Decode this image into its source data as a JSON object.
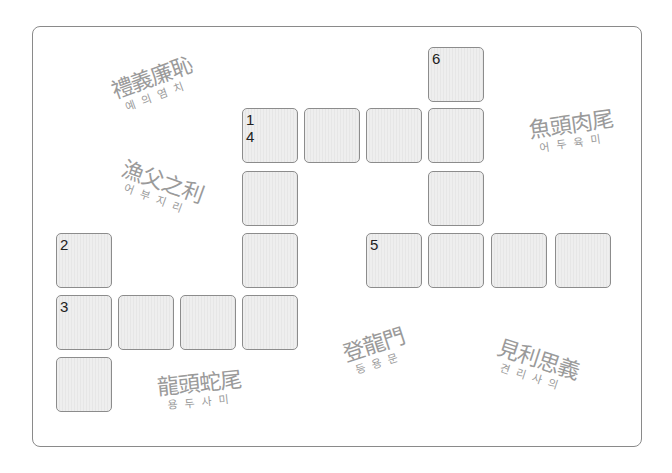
{
  "puzzle": {
    "type": "crossword",
    "cell_fill": "#eaeaea",
    "cell_border": "#8c8c8c",
    "cells": [
      {
        "row": 0,
        "col": 6,
        "label": "6"
      },
      {
        "row": 1,
        "col": 3,
        "label": "1\n4"
      },
      {
        "row": 1,
        "col": 4,
        "label": ""
      },
      {
        "row": 1,
        "col": 5,
        "label": ""
      },
      {
        "row": 1,
        "col": 6,
        "label": ""
      },
      {
        "row": 2,
        "col": 3,
        "label": ""
      },
      {
        "row": 2,
        "col": 6,
        "label": ""
      },
      {
        "row": 3,
        "col": 0,
        "label": "2"
      },
      {
        "row": 3,
        "col": 3,
        "label": ""
      },
      {
        "row": 3,
        "col": 5,
        "label": "5"
      },
      {
        "row": 3,
        "col": 6,
        "label": ""
      },
      {
        "row": 3,
        "col": 7,
        "label": ""
      },
      {
        "row": 3,
        "col": 8,
        "label": ""
      },
      {
        "row": 4,
        "col": 0,
        "label": "3"
      },
      {
        "row": 4,
        "col": 1,
        "label": ""
      },
      {
        "row": 4,
        "col": 2,
        "label": ""
      },
      {
        "row": 4,
        "col": 3,
        "label": ""
      },
      {
        "row": 5,
        "col": 0,
        "label": ""
      }
    ]
  },
  "idioms": [
    {
      "id": "ye-ui-yeom-chi",
      "hanja": "禮義廉恥",
      "hangul": "예의염치"
    },
    {
      "id": "eo-bu-ji-ri",
      "hanja": "漁父之利",
      "hangul": "어부지리"
    },
    {
      "id": "eo-du-yuk-mi",
      "hanja": "魚頭肉尾",
      "hangul": "어두육미"
    },
    {
      "id": "deung-yong-mun",
      "hanja": "登龍門",
      "hangul": "등용문"
    },
    {
      "id": "gyeon-ri-sa-ui",
      "hanja": "見利思義",
      "hangul": "견리사의"
    },
    {
      "id": "yong-du-sa-mi",
      "hanja": "龍頭蛇尾",
      "hangul": "용두사미"
    }
  ]
}
